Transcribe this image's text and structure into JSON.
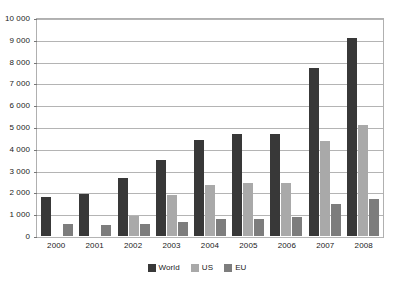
{
  "chart_data": {
    "type": "bar",
    "title": "",
    "subtitle": "",
    "xlabel": "",
    "ylabel": "",
    "categories": [
      "2000",
      "2001",
      "2002",
      "2003",
      "2004",
      "2005",
      "2006",
      "2007",
      "2008"
    ],
    "series": [
      {
        "name": "World",
        "color": "#383838",
        "values": [
          1800,
          1950,
          2650,
          3500,
          4400,
          4700,
          4700,
          7700,
          9100
        ]
      },
      {
        "name": "US",
        "color": "#a9a9a9",
        "values": [
          0,
          0,
          900,
          1900,
          2350,
          2450,
          2450,
          4350,
          5100
        ]
      },
      {
        "name": "EU",
        "color": "#7d7d7d",
        "values": [
          550,
          500,
          550,
          650,
          800,
          800,
          850,
          1450,
          1700
        ]
      }
    ],
    "ylim": [
      0,
      10000
    ],
    "ytick_step": 1000,
    "ytick_labels": [
      "10 000",
      "9 000",
      "8 000",
      "7 000",
      "6 000",
      "5 000",
      "4 000",
      "3 000",
      "2 000",
      "1 000",
      "0"
    ],
    "ytick_values": [
      10000,
      9000,
      8000,
      7000,
      6000,
      5000,
      4000,
      3000,
      2000,
      1000,
      0
    ],
    "grid": true,
    "legend_position": "bottom"
  },
  "legend": {
    "items": [
      {
        "label": "World"
      },
      {
        "label": "US"
      },
      {
        "label": "EU"
      }
    ]
  }
}
